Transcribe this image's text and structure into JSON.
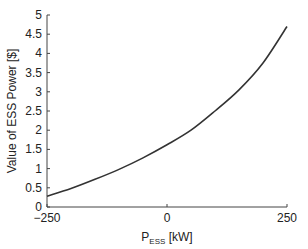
{
  "chart_data": {
    "type": "line",
    "title": "",
    "xlabel": "P_ESS [kW]",
    "xlabel_main": "P",
    "xlabel_sub": "ESS",
    "xlabel_unit": " [kW]",
    "ylabel": "Value of ESS Power [$]",
    "xlim": [
      -250,
      250
    ],
    "ylim": [
      0,
      5
    ],
    "xticks": [
      -250,
      0,
      250
    ],
    "xtick_labels": [
      "−250",
      "0",
      "250"
    ],
    "yticks": [
      0,
      0.5,
      1,
      1.5,
      2,
      2.5,
      3,
      3.5,
      4,
      4.5,
      5
    ],
    "ytick_labels": [
      "0",
      "0.5",
      "1",
      "1.5",
      "2",
      "2.5",
      "3",
      "3.5",
      "4",
      "4.5",
      "5"
    ],
    "grid": false,
    "legend": null,
    "series": [
      {
        "name": "Value of ESS Power",
        "color": "#333333",
        "x": [
          -250,
          -200,
          -150,
          -100,
          -50,
          0,
          50,
          100,
          150,
          200,
          250
        ],
        "y": [
          0.28,
          0.48,
          0.72,
          0.98,
          1.28,
          1.62,
          2.0,
          2.5,
          3.05,
          3.75,
          4.7
        ]
      }
    ]
  }
}
